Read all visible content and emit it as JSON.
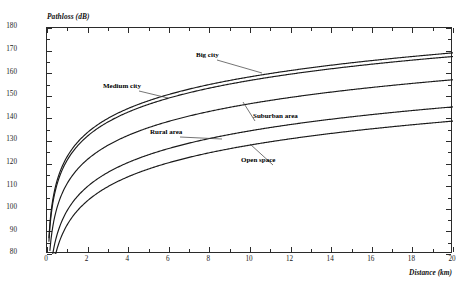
{
  "figure": {
    "background": "#ffffff",
    "line_color": "#1a1a1a",
    "axis_color": "#2b2b2b"
  },
  "axes": {
    "y_title": "Pathloss (dB)",
    "x_title": "Distance (km)",
    "y_ticks": [
      "80",
      "90",
      "100",
      "110",
      "120",
      "130",
      "140",
      "150",
      "160",
      "170",
      "180"
    ],
    "x_ticks": [
      "0",
      "2",
      "4",
      "6",
      "8",
      "10",
      "12",
      "14",
      "16",
      "18",
      "20"
    ]
  },
  "annotations": [
    {
      "label": "Big city",
      "x": 196,
      "y": 52
    },
    {
      "label": "Medium city",
      "x": 103,
      "y": 83
    },
    {
      "label": "Suburban area",
      "x": 253,
      "y": 113
    },
    {
      "label": "Rural area",
      "x": 150,
      "y": 129
    },
    {
      "label": "Open space",
      "x": 241,
      "y": 157
    }
  ],
  "chart_data": {
    "type": "line",
    "title": "",
    "xlabel": "Distance (km)",
    "ylabel": "Pathloss (dB)",
    "xlim": [
      0,
      20
    ],
    "ylim": [
      80,
      180
    ],
    "xtick_step": 2,
    "ytick_step": 10,
    "grid": false,
    "legend": "inline-annotations",
    "x": [
      0.1,
      0.2,
      0.3,
      0.5,
      0.7,
      1,
      1.5,
      2,
      3,
      4,
      5,
      6,
      7,
      8,
      9,
      10,
      12,
      14,
      16,
      18,
      20
    ],
    "series": [
      {
        "name": "Big city",
        "label_position": "upper-middle",
        "values": [
          123.4,
          133.1,
          138.8,
          146.0,
          150.5,
          155.0,
          160.9,
          165.1,
          170.9,
          175.1,
          178.3,
          181.0,
          183.2,
          185.2,
          186.9,
          188.4,
          191.0,
          193.2,
          195.1,
          196.7,
          198.2
        ]
      },
      {
        "name": "Medium city",
        "label_position": "left-middle",
        "values": [
          121.8,
          131.5,
          137.2,
          144.4,
          148.9,
          153.4,
          159.3,
          163.5,
          169.3,
          173.5,
          176.7,
          179.4,
          181.6,
          183.6,
          185.3,
          186.8,
          189.4,
          191.6,
          193.5,
          195.1,
          196.6
        ]
      },
      {
        "name": "Suburban area",
        "label_position": "right-middle",
        "values": [
          111.5,
          121.2,
          126.9,
          134.1,
          138.6,
          143.1,
          149.0,
          153.2,
          159.0,
          163.2,
          166.4,
          169.1,
          171.3,
          173.3,
          175.0,
          176.5,
          179.1,
          181.3,
          183.2,
          184.8,
          186.3
        ]
      },
      {
        "name": "Rural area",
        "label_position": "left-lower",
        "values": [
          93.3,
          103.0,
          108.7,
          115.9,
          120.4,
          124.9,
          130.8,
          135.0,
          140.8,
          145.0,
          148.2,
          150.9,
          153.1,
          155.1,
          156.8,
          158.3,
          160.9,
          163.1,
          165.0,
          166.6,
          168.1
        ]
      },
      {
        "name": "Open space",
        "label_position": "right-lower",
        "values": [
          87.0,
          96.7,
          102.4,
          109.6,
          114.1,
          118.6,
          124.5,
          128.7,
          134.5,
          138.7,
          141.9,
          144.6,
          146.8,
          148.8,
          150.5,
          152.0,
          154.6,
          156.8,
          158.7,
          160.3,
          161.8
        ]
      }
    ],
    "series_rendered_endpoints_at_20km": {
      "Big city": 169.0,
      "Medium city": 167.4,
      "Suburban area": 157.1,
      "Rural area": 145.1,
      "Open space": 138.8
    }
  }
}
